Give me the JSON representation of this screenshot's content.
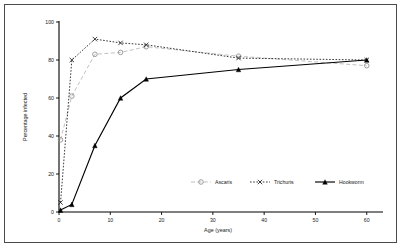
{
  "figure": {
    "border_color": "#4a4a4a",
    "background": "#ffffff"
  },
  "axes": {
    "x_title": "Age (years)",
    "y_title": "Percentage infected",
    "x_ticks": [
      "0",
      "10",
      "20",
      "30",
      "40",
      "50",
      "60"
    ],
    "y_ticks": [
      "0",
      "20",
      "40",
      "60",
      "80",
      "100"
    ]
  },
  "legend": {
    "position": "inside-lower-right",
    "items": [
      {
        "label": "Ascaris",
        "marker": "open-circle",
        "color": "#b9b9b9",
        "dash": "long-dash"
      },
      {
        "label": "Trichuris",
        "marker": "x-cross",
        "color": "#222222",
        "dash": "dotted"
      },
      {
        "label": "Hookworm",
        "marker": "filled-triangle",
        "color": "#000000",
        "dash": "solid"
      }
    ]
  },
  "chart_data": {
    "type": "line",
    "title": "",
    "xlabel": "Age (years)",
    "ylabel": "Percentage infected",
    "xlim": [
      0,
      62
    ],
    "ylim": [
      0,
      100
    ],
    "xticks": [
      0,
      10,
      20,
      30,
      40,
      50,
      60
    ],
    "yticks": [
      0,
      20,
      40,
      60,
      80,
      100
    ],
    "grid": false,
    "legend_position": "lower right (inside axes)",
    "series": [
      {
        "name": "Ascaris",
        "marker": "open-circle",
        "color": "#b9b9b9",
        "linestyle": "dashed",
        "x": [
          0.3,
          2.5,
          7,
          12,
          17,
          35,
          60
        ],
        "y": [
          38,
          61,
          83,
          84,
          87,
          82,
          77
        ]
      },
      {
        "name": "Trichuris",
        "marker": "x",
        "color": "#222222",
        "linestyle": "dotted",
        "x": [
          0.3,
          2.5,
          7,
          12,
          17,
          35,
          60
        ],
        "y": [
          5,
          80,
          91,
          89,
          88,
          81,
          80
        ]
      },
      {
        "name": "Hookworm",
        "marker": "filled-triangle",
        "color": "#000000",
        "linestyle": "solid",
        "x": [
          0.3,
          2.5,
          7,
          12,
          17,
          35,
          60
        ],
        "y": [
          1,
          4,
          35,
          60,
          70,
          75,
          80
        ]
      }
    ]
  }
}
